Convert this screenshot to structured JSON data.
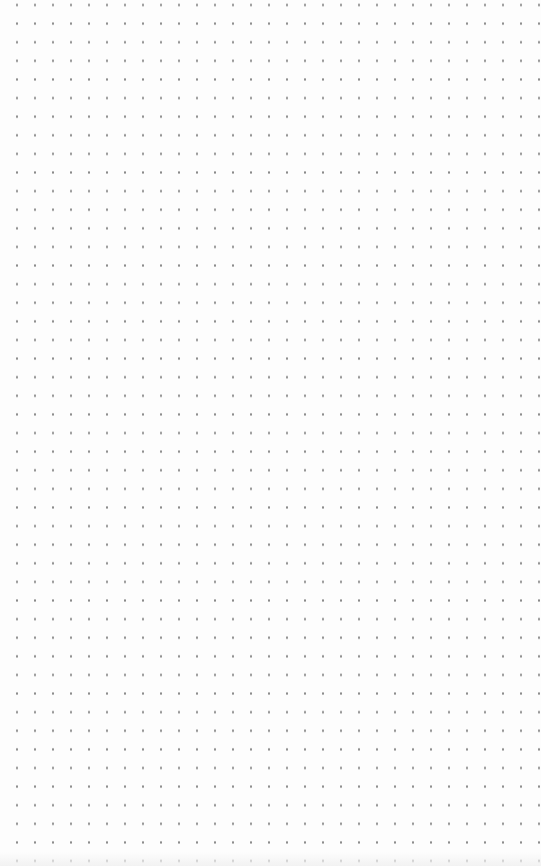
{
  "canvas": {
    "pattern": "dot-grid",
    "background_color": "#fdfdfd",
    "dot_color": "#8a8a8a",
    "dot_spacing_x": 18,
    "dot_spacing_y": 18.6,
    "columns": 29,
    "rows": 46
  }
}
